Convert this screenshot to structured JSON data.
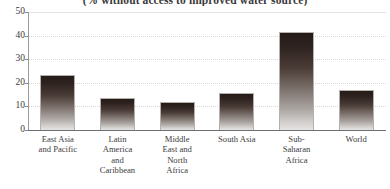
{
  "chart_data": {
    "type": "bar",
    "title": "(% without access to improved water source)",
    "xlabel": "",
    "ylabel": "",
    "ylim": [
      0,
      50
    ],
    "yticks": [
      0,
      10,
      20,
      30,
      40,
      50
    ],
    "grid": true,
    "legend": "none",
    "categories": [
      "East Asia and Pacific",
      "Latin America and Caribbean",
      "Middle East and North Africa",
      "South Asia",
      "Sub-Saharan Africa",
      "World"
    ],
    "category_lines": [
      [
        "East Asia",
        "and Pacific"
      ],
      [
        "Latin",
        "America",
        "and",
        "Caribbean"
      ],
      [
        "Middle",
        "East and",
        "North",
        "Africa"
      ],
      [
        "South Asia"
      ],
      [
        "Sub-",
        "Saharan",
        "Africa"
      ],
      [
        "World"
      ]
    ],
    "values": [
      23.5,
      13.5,
      12,
      15.5,
      41.5,
      17
    ],
    "bar_style": {
      "gradient_top": "#241a16",
      "gradient_bottom": "#e6e4e3",
      "border": "#b4b0ad"
    }
  },
  "axis": {
    "y_tick_labels": [
      "50",
      "40",
      "30",
      "20",
      "10",
      "0"
    ]
  }
}
